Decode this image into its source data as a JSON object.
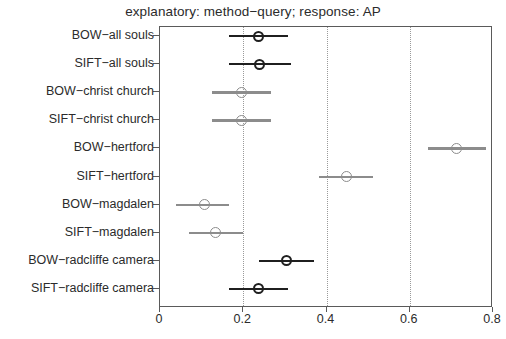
{
  "chart_data": {
    "type": "scatter",
    "title": "explanatory: method−query; response: AP",
    "xlabel": "",
    "ylabel": "",
    "xlim": [
      0,
      0.8
    ],
    "xticks": [
      0,
      0.2,
      0.4,
      0.6,
      0.8
    ],
    "xticklabels": [
      "0",
      "0.2",
      "0.4",
      "0.6",
      "0.8"
    ],
    "grid": "vertical-dotted",
    "legend": "none",
    "orientation": "horizontal",
    "marker": "open-circle-with-error-bar",
    "categories": [
      "BOW−all souls",
      "SIFT−all souls",
      "BOW−christ church",
      "SIFT−christ church",
      "BOW−hertford",
      "SIFT−hertford",
      "BOW−magdalen",
      "SIFT−magdalen",
      "BOW−radcliffe camera",
      "SIFT−radcliffe camera"
    ],
    "values": [
      0.236,
      0.24,
      0.195,
      0.195,
      0.712,
      0.447,
      0.106,
      0.134,
      0.303,
      0.236
    ],
    "ci_low": [
      0.166,
      0.166,
      0.125,
      0.125,
      0.644,
      0.382,
      0.038,
      0.07,
      0.238,
      0.166
    ],
    "ci_high": [
      0.308,
      0.314,
      0.267,
      0.267,
      0.783,
      0.512,
      0.166,
      0.199,
      0.37,
      0.308
    ],
    "emphasis": [
      "dark",
      "dark",
      "gray",
      "gray",
      "gray",
      "gray",
      "gray",
      "gray",
      "dark",
      "dark"
    ],
    "colors": {
      "dark": "#1f1f1f",
      "gray": "#8c8c8c",
      "axis": "#5a5a5a",
      "grid": "#9a9a9a",
      "background": "#ffffff",
      "text": "#2b2b2b"
    }
  }
}
